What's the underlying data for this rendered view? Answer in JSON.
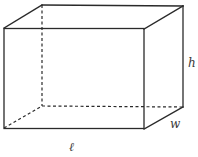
{
  "diagram": {
    "labels": {
      "length": "ℓ",
      "width": "w",
      "height": "h"
    },
    "vertices": {
      "front_top_left": [
        4,
        28
      ],
      "front_top_right": [
        144,
        29
      ],
      "front_bottom_left": [
        4,
        128
      ],
      "front_bottom_right": [
        144,
        129
      ],
      "back_top_left": [
        42,
        5
      ],
      "back_top_right": [
        183,
        6
      ],
      "back_bottom_left": [
        42,
        106
      ],
      "back_bottom_right": [
        183,
        107
      ]
    },
    "colors": {
      "stroke": "#2a2a2a",
      "label": "#3a3a3a",
      "background": "#ffffff"
    }
  }
}
